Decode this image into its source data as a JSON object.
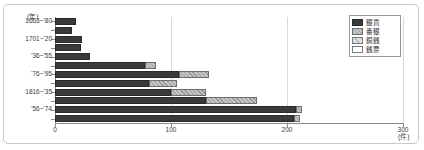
{
  "chart_data": {
    "type": "bar",
    "orientation": "horizontal",
    "stacked": true,
    "title": "",
    "xlabel": "",
    "ylabel": "",
    "x_unit": "(件)",
    "y_unit": "(年)",
    "xlim": [
      0,
      300
    ],
    "xticks": [
      0,
      100,
      200,
      300
    ],
    "xtick_labels": [
      "0",
      "100",
      "200",
      "300"
    ],
    "grid": true,
    "grid_axis": "x",
    "legend_position": "top-right",
    "categories": [
      "1663~'80",
      "'81~1700",
      "1701~'20",
      "'21~'35",
      "'36~'55",
      "'56~'75",
      "'76~'95",
      "1816~'35",
      "'36~'55",
      "'56~'74",
      "'75~'94",
      "'95~1912"
    ],
    "visible_tick_labels": [
      "1663~'80",
      "1701~'20",
      "'36~'55",
      "'76~'95",
      "1816~'35",
      "'56~'74",
      "'95~1912"
    ],
    "series": [
      {
        "name": "銀貨",
        "color": "#3a3a3a",
        "values": [
          18,
          15,
          23,
          22,
          30,
          78,
          107,
          81,
          100,
          130,
          208,
          206
        ]
      },
      {
        "name": "番銀",
        "color": "#c4c4c4",
        "values": [
          0,
          0,
          0,
          0,
          0,
          9,
          26,
          24,
          30,
          44,
          5,
          5
        ]
      },
      {
        "name": "銅銭",
        "color": "#e2e2e2",
        "values": [
          0,
          0,
          0,
          0,
          0,
          0,
          0,
          0,
          0,
          0,
          0,
          0
        ]
      },
      {
        "name": "銭票",
        "color": "#ffffff",
        "values": [
          0,
          0,
          0,
          0,
          0,
          0,
          0,
          0,
          0,
          0,
          0,
          0
        ]
      }
    ],
    "bar_rows": [
      {
        "label": "1663~'80",
        "segments": [
          18
        ]
      },
      {
        "label": "'81~1700",
        "segments": [
          15
        ]
      },
      {
        "label": "1701~'20",
        "segments": [
          23
        ]
      },
      {
        "label": "'21~'35",
        "segments": [
          22
        ]
      },
      {
        "label": "'36~'55",
        "segments": [
          30
        ]
      },
      {
        "label": "'56~'75",
        "segments": [
          78,
          9
        ]
      },
      {
        "label": "'76~'95",
        "segments": [
          107,
          26
        ]
      },
      {
        "label": "1816~'15",
        "segments": [
          81,
          24
        ]
      },
      {
        "label": "1816~'35",
        "segments": [
          100,
          30
        ]
      },
      {
        "label": "'36~'55",
        "segments": [
          130,
          44
        ]
      },
      {
        "label": "'56~'74",
        "segments": [
          208,
          5
        ]
      },
      {
        "label": "'95~1912",
        "segments": [
          206,
          5
        ]
      }
    ],
    "legend": [
      {
        "label": "銀貨",
        "pattern": "solid-dark"
      },
      {
        "label": "番銀",
        "pattern": "hatched"
      },
      {
        "label": "銅銭",
        "pattern": "light-hatched"
      },
      {
        "label": "銭票",
        "pattern": "white"
      }
    ]
  }
}
